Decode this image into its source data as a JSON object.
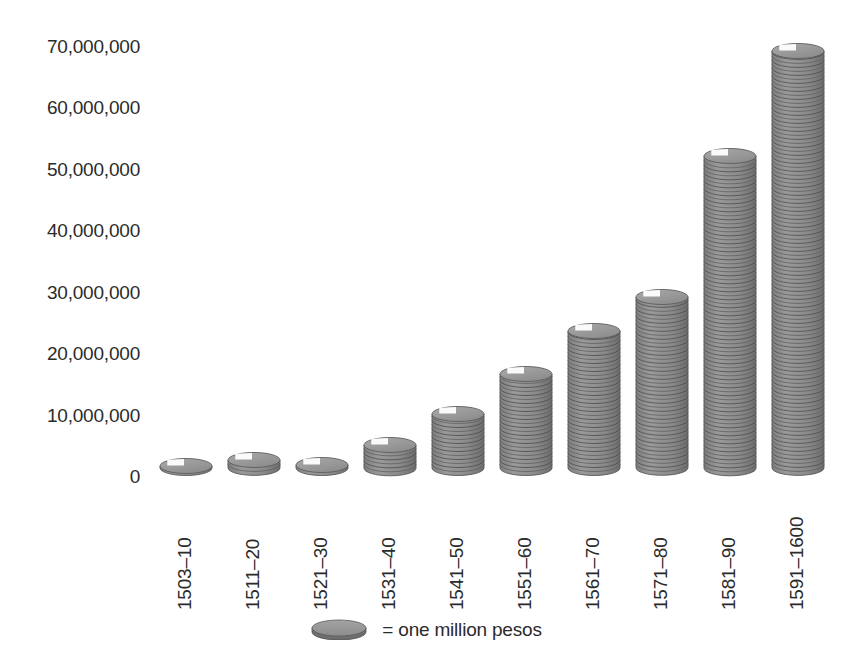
{
  "chart_data": {
    "type": "bar",
    "title": "",
    "subtitle": "",
    "xlabel": "",
    "ylabel": "",
    "categories": [
      "1503–10",
      "1511–20",
      "1521–30",
      "1531–40",
      "1541–50",
      "1551–60",
      "1561–70",
      "1571–80",
      "1581–90",
      "1591–1600"
    ],
    "values": [
      1500000,
      2500000,
      1700000,
      5000000,
      10000000,
      16500000,
      23500000,
      29000000,
      52000000,
      69000000
    ],
    "ylim": [
      0,
      70000000
    ],
    "ytick_values": [
      0,
      10000000,
      20000000,
      30000000,
      40000000,
      50000000,
      60000000,
      70000000
    ],
    "ytick_labels": [
      "0",
      "10,000,000",
      "20,000,000",
      "30,000,000",
      "40,000,000",
      "50,000,000",
      "60,000,000",
      "70,000,000"
    ],
    "grid": false,
    "legend_position": "bottom",
    "legend": [
      {
        "symbol": "coin-icon",
        "equals_sign": "=",
        "label": "one million pesos",
        "full_text": "= one million pesos",
        "unit_value": 1000000
      }
    ],
    "bar_style": "stacked-coins",
    "colors": {
      "coin_body": "#8b8b8b",
      "coin_body_dark": "#636363",
      "coin_top": "#9a9a9a",
      "coin_edge": "#4f4f4f",
      "text": "#2b2b2b",
      "background": "#ffffff"
    }
  },
  "axes": {
    "y": {
      "ticks": [
        {
          "value": 70000000,
          "label": "70,000,000"
        },
        {
          "value": 60000000,
          "label": "60,000,000"
        },
        {
          "value": 50000000,
          "label": "50,000,000"
        },
        {
          "value": 40000000,
          "label": "40,000,000"
        },
        {
          "value": 30000000,
          "label": "30,000,000"
        },
        {
          "value": 20000000,
          "label": "20,000,000"
        },
        {
          "value": 10000000,
          "label": "10,000,000"
        },
        {
          "value": 0,
          "label": "0"
        }
      ]
    },
    "x": {
      "ticks": [
        {
          "label": "1503–10"
        },
        {
          "label": "1511–20"
        },
        {
          "label": "1521–30"
        },
        {
          "label": "1531–40"
        },
        {
          "label": "1541–50"
        },
        {
          "label": "1551–60"
        },
        {
          "label": "1561–70"
        },
        {
          "label": "1571–80"
        },
        {
          "label": "1581–90"
        },
        {
          "label": "1591–1600"
        }
      ]
    }
  },
  "legend": {
    "equals": "=",
    "text": "one million pesos"
  }
}
